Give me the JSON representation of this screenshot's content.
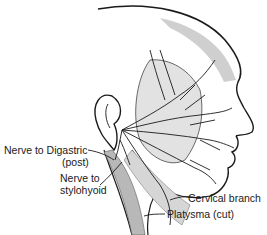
{
  "figure": {
    "labels": {
      "digastric_line1": "Nerve to Digastric",
      "digastric_line2": "(post)",
      "stylohyoid_line1": "Nerve to",
      "stylohyoid_line2": "stylohyoid",
      "cervical": "Cervical branch",
      "platysma": "Platysma (cut)"
    },
    "colors": {
      "ink": "#1a1a1a",
      "shade": "#9a9a9a",
      "background": "#ffffff"
    }
  }
}
